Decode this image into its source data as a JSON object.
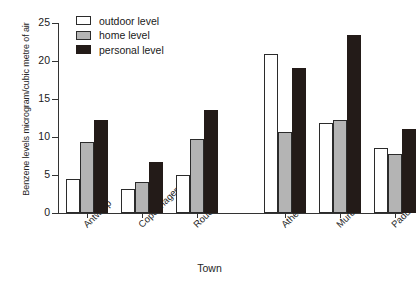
{
  "chart_data": {
    "type": "bar",
    "title": "",
    "xlabel": "Town",
    "ylabel": "Benzene levels microgram/cubic metre of air",
    "categories": [
      "Antwerp",
      "Copenhagen",
      "Rouen",
      "Athens",
      "Murcia",
      "Padua"
    ],
    "series": [
      {
        "name": "outdoor level",
        "color": "#ffffff",
        "values": [
          4.5,
          3.2,
          5.0,
          20.9,
          11.8,
          8.5
        ]
      },
      {
        "name": "home level",
        "color": "#b4b4b4",
        "values": [
          9.3,
          4.1,
          9.8,
          10.7,
          12.3,
          7.7
        ]
      },
      {
        "name": "personal level",
        "color": "#231b18",
        "values": [
          12.3,
          6.7,
          13.6,
          19.1,
          23.4,
          11.0
        ]
      }
    ],
    "ylim": [
      0,
      25
    ],
    "yticks": [
      0,
      5,
      10,
      15,
      20,
      25
    ],
    "ytick_labels": [
      "0",
      "5",
      "10",
      "15",
      "20",
      "25"
    ],
    "grid": false,
    "legend_position": "top-left",
    "group_gap_after_index": 2
  },
  "axes": {
    "y_title": "Benzene levels microgram/cubic metre of air",
    "x_title": "Town"
  },
  "legend": {
    "items": [
      {
        "label": "outdoor level"
      },
      {
        "label": "home level"
      },
      {
        "label": "personal level"
      }
    ]
  }
}
